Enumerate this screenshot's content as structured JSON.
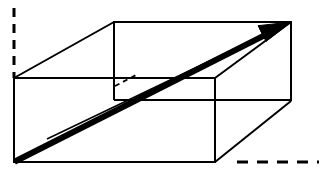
{
  "figure": {
    "kind": "geometry-diagram",
    "background_color": "#ffffff",
    "ink_color": "#000000",
    "canvas": {
      "width": 324,
      "height": 170
    },
    "labels": [],
    "annotations": []
  },
  "geometry": {
    "projection": "oblique-parallel",
    "depth_offset": {
      "dx": 100,
      "dy": -56
    },
    "vertices": {
      "front_bottom_left": {
        "x": 14,
        "y": 162
      },
      "front_bottom_right": {
        "x": 215,
        "y": 162
      },
      "front_top_left": {
        "x": 14,
        "y": 78
      },
      "front_top_right": {
        "x": 215,
        "y": 78
      },
      "back_bottom_left": {
        "x": 114,
        "y": 100
      },
      "back_bottom_right": {
        "x": 291,
        "y": 100
      },
      "back_top_left": {
        "x": 114,
        "y": 22
      },
      "back_top_right": {
        "x": 291,
        "y": 22
      }
    },
    "visible_edges": [
      {
        "name": "front-bottom-edge",
        "from": "front_bottom_left",
        "to": "front_bottom_right"
      },
      {
        "name": "front-top-edge",
        "from": "front_top_left",
        "to": "front_top_right"
      },
      {
        "name": "front-left-edge",
        "from": "front_top_left",
        "to": "front_bottom_left"
      },
      {
        "name": "front-right-edge",
        "from": "front_top_right",
        "to": "front_bottom_right"
      },
      {
        "name": "back-top-edge",
        "from": "back_top_left",
        "to": "back_top_right"
      },
      {
        "name": "back-right-vertical",
        "from": "back_top_right",
        "to": "back_bottom_right"
      },
      {
        "name": "back-bottom-right-edge",
        "from": "back_bottom_left",
        "to": "back_bottom_right"
      },
      {
        "name": "back-left-vertical",
        "from": "back_top_left",
        "to": "back_bottom_left"
      },
      {
        "name": "top-left-depth-edge",
        "from": "front_top_left",
        "to": "back_top_left"
      },
      {
        "name": "top-right-depth-edge",
        "from": "front_top_right",
        "to": "back_top_right"
      },
      {
        "name": "bottom-right-depth-edge",
        "from": "front_bottom_right",
        "to": "back_bottom_right"
      }
    ],
    "hidden_edges": [
      {
        "name": "bottom-left-depth-edge-hidden",
        "from": "front_top_left_interior",
        "to": "back_bottom_left"
      }
    ],
    "space_diagonal": {
      "name": "space-diagonal-arrow",
      "from": "front_bottom_left",
      "to": "back_top_right",
      "style": "thick-solid-with-arrowhead",
      "stroke_width": 6,
      "arrowhead": "filled-triangle"
    },
    "secondary_diagonal": {
      "name": "face-diagonal-thin",
      "from": {
        "x": 47,
        "y": 139
      },
      "to": "back_top_right",
      "style": "thin-solid",
      "stroke_width": 1.6
    },
    "axis_guides": [
      {
        "name": "left-vertical-dashed-axis",
        "orientation": "vertical",
        "from": {
          "x": 14,
          "y": 8
        },
        "to": {
          "x": 14,
          "y": 78
        },
        "dash_pattern": "9 7"
      },
      {
        "name": "bottom-right-horizontal-dashed-axis",
        "orientation": "horizontal",
        "from": {
          "x": 237,
          "y": 162
        },
        "to": {
          "x": 319,
          "y": 162
        },
        "dash_pattern": "11 9"
      }
    ]
  },
  "strokes": {
    "edge_width": 2.0,
    "hidden_width": 1.8,
    "hidden_dash": "5 4",
    "axis_width": 3.0,
    "diagonal_thick_width": 6.0,
    "diagonal_thin_width": 1.6
  }
}
